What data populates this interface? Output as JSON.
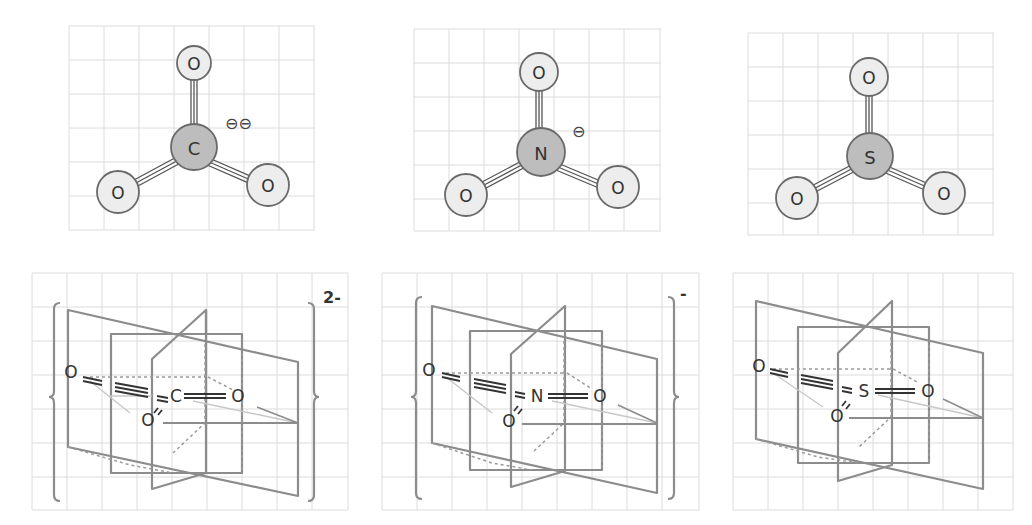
{
  "figure": {
    "top_row": [
      {
        "id": "carbonate",
        "central_atom": "C",
        "ligands": [
          "O",
          "O",
          "O"
        ],
        "charge_symbol": "⊖⊖",
        "charge_count": 2
      },
      {
        "id": "nitrate",
        "central_atom": "N",
        "ligands": [
          "O",
          "O",
          "O"
        ],
        "charge_symbol": "⊖",
        "charge_count": 1
      },
      {
        "id": "sulfur-trioxide",
        "central_atom": "S",
        "ligands": [
          "O",
          "O",
          "O"
        ],
        "charge_symbol": "",
        "charge_count": 0
      }
    ],
    "bottom_row": [
      {
        "id": "carbonate-3d",
        "central_atom": "C",
        "left_o": "O",
        "front_o": "O",
        "right_o": "O",
        "charge_label": "2-",
        "bracketed": true
      },
      {
        "id": "nitrate-3d",
        "central_atom": "N",
        "left_o": "O",
        "front_o": "O",
        "right_o": "O",
        "charge_label": "-",
        "bracketed": true
      },
      {
        "id": "sulfur-trioxide-3d",
        "central_atom": "S",
        "left_o": "O",
        "front_o": "O",
        "right_o": "O",
        "charge_label": "",
        "bracketed": false
      }
    ]
  },
  "colors": {
    "grid": "#dcdcdc",
    "oxygen_fill": "#ededed",
    "central_fill": "#bdbdbd",
    "outline": "#6a6a6a",
    "plane": "#8c8c8c"
  }
}
